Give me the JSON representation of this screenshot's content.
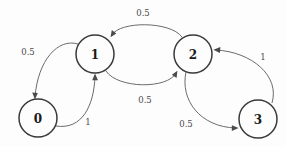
{
  "diagram": {
    "type": "state-transition-graph",
    "background_color": "#fdfdfd",
    "node_stroke_color": "#3a3a3a",
    "edge_color": "#6b6b6b",
    "label_color": "#4a4a4a",
    "nodes": [
      {
        "id": "0",
        "label": "0",
        "cx": 38,
        "cy": 118,
        "r": 19
      },
      {
        "id": "1",
        "label": "1",
        "cx": 95,
        "cy": 54,
        "r": 19
      },
      {
        "id": "2",
        "label": "2",
        "cx": 193,
        "cy": 54,
        "r": 19
      },
      {
        "id": "3",
        "label": "3",
        "cx": 258,
        "cy": 119,
        "r": 19
      }
    ],
    "edges": [
      {
        "id": "e0-1",
        "from": "0",
        "to": "1",
        "label": "1",
        "label_x": 88,
        "label_y": 122
      },
      {
        "id": "e1-0",
        "from": "1",
        "to": "0",
        "label": "0.5",
        "label_x": 28,
        "label_y": 52
      },
      {
        "id": "e1-2",
        "from": "1",
        "to": "2",
        "label": "0.5",
        "label_x": 145,
        "label_y": 100
      },
      {
        "id": "e2-1",
        "from": "2",
        "to": "1",
        "label": "0.5",
        "label_x": 143,
        "label_y": 13
      },
      {
        "id": "e2-3",
        "from": "2",
        "to": "3",
        "label": "0.5",
        "label_x": 186,
        "label_y": 124
      },
      {
        "id": "e3-2",
        "from": "3",
        "to": "2",
        "label": "1",
        "label_x": 263,
        "label_y": 57
      }
    ]
  }
}
